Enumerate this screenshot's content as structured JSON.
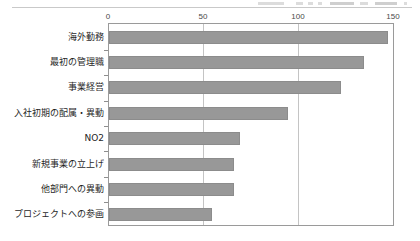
{
  "chart_data": {
    "type": "bar",
    "orientation": "horizontal",
    "title": "",
    "subtitle": "",
    "xlabel": "",
    "ylabel": "",
    "xlim": [
      0,
      150
    ],
    "ylim": null,
    "grid": true,
    "gridlines_x": [
      0,
      50,
      100,
      150
    ],
    "legend": null,
    "legend_position": "none",
    "xticks": [
      "0",
      "50",
      "100",
      "150"
    ],
    "xtick_values": [
      0,
      50,
      100,
      150
    ],
    "categories": [
      "海外勤務",
      "最初の管理職",
      "事業経営",
      "入社初期の配属・異動",
      "NO2",
      "新規事業の立上げ",
      "他部門への異動",
      "プロジェクトへの参画"
    ],
    "values": [
      147,
      134,
      122,
      94,
      69,
      66,
      66,
      54
    ],
    "series": [
      {
        "name": "",
        "values": [
          147,
          134,
          122,
          94,
          69,
          66,
          66,
          54
        ]
      }
    ],
    "bar_color": "#989898",
    "bar_edge_color": "#8c8c8c",
    "axis_color": "#9a9a9a",
    "grid_color": "#c4c4c4"
  },
  "figure": {
    "name": "horizontal-bar-chart",
    "background": "#ffffff"
  }
}
